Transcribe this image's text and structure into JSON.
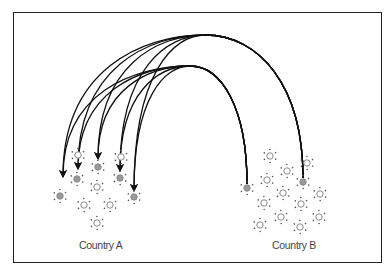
{
  "diagram": {
    "type": "migration-flow",
    "labels": {
      "country_a": "Country A",
      "country_b": "Country B"
    },
    "colors": {
      "frame": "#222222",
      "arc": "#111111",
      "node_hollow_stroke": "#8a8a8a",
      "node_filled": "#9a9a9a",
      "node_dots": "#555555",
      "label": "#444444"
    },
    "country_a_nodes": [
      {
        "x": 78,
        "y": 155,
        "filled": false
      },
      {
        "x": 98,
        "y": 167,
        "filled": true
      },
      {
        "x": 121,
        "y": 157,
        "filled": false
      },
      {
        "x": 77,
        "y": 179,
        "filled": true
      },
      {
        "x": 120,
        "y": 178,
        "filled": true
      },
      {
        "x": 97,
        "y": 187,
        "filled": false
      },
      {
        "x": 60,
        "y": 196,
        "filled": true
      },
      {
        "x": 84,
        "y": 205,
        "filled": false
      },
      {
        "x": 110,
        "y": 205,
        "filled": false
      },
      {
        "x": 134,
        "y": 197,
        "filled": true
      },
      {
        "x": 97,
        "y": 223,
        "filled": false
      }
    ],
    "country_b_nodes": [
      {
        "x": 270,
        "y": 156,
        "filled": false
      },
      {
        "x": 307,
        "y": 163,
        "filled": false
      },
      {
        "x": 287,
        "y": 171,
        "filled": false
      },
      {
        "x": 267,
        "y": 180,
        "filled": false
      },
      {
        "x": 303,
        "y": 182,
        "filled": true
      },
      {
        "x": 247,
        "y": 188,
        "filled": true
      },
      {
        "x": 283,
        "y": 193,
        "filled": false
      },
      {
        "x": 320,
        "y": 194,
        "filled": false
      },
      {
        "x": 264,
        "y": 203,
        "filled": false
      },
      {
        "x": 301,
        "y": 204,
        "filled": false
      },
      {
        "x": 281,
        "y": 217,
        "filled": false
      },
      {
        "x": 319,
        "y": 217,
        "filled": false
      },
      {
        "x": 260,
        "y": 225,
        "filled": false
      },
      {
        "x": 300,
        "y": 227,
        "filled": false
      }
    ],
    "flows": [
      {
        "from": "B-outer",
        "source": [
          303,
          178
        ],
        "peak": [
          205,
          35
        ],
        "target": [
          63,
          176
        ]
      },
      {
        "from": "B-outer",
        "source": [
          303,
          178
        ],
        "peak": [
          205,
          35
        ],
        "target": [
          78,
          168
        ]
      },
      {
        "from": "B-outer",
        "source": [
          303,
          178
        ],
        "peak": [
          205,
          35
        ],
        "target": [
          98,
          158
        ]
      },
      {
        "from": "B-outer",
        "source": [
          303,
          178
        ],
        "peak": [
          205,
          35
        ],
        "target": [
          120,
          170
        ]
      },
      {
        "from": "B-outer",
        "source": [
          303,
          178
        ],
        "peak": [
          205,
          35
        ],
        "target": [
          134,
          190
        ]
      },
      {
        "from": "B-inner",
        "source": [
          247,
          184
        ],
        "peak": [
          190,
          66
        ],
        "target": [
          63,
          176
        ]
      },
      {
        "from": "B-inner",
        "source": [
          247,
          184
        ],
        "peak": [
          190,
          66
        ],
        "target": [
          78,
          168
        ]
      },
      {
        "from": "B-inner",
        "source": [
          247,
          184
        ],
        "peak": [
          190,
          66
        ],
        "target": [
          98,
          158
        ]
      },
      {
        "from": "B-inner",
        "source": [
          247,
          184
        ],
        "peak": [
          190,
          66
        ],
        "target": [
          120,
          170
        ]
      },
      {
        "from": "B-inner",
        "source": [
          247,
          184
        ],
        "peak": [
          190,
          66
        ],
        "target": [
          134,
          190
        ]
      }
    ]
  }
}
